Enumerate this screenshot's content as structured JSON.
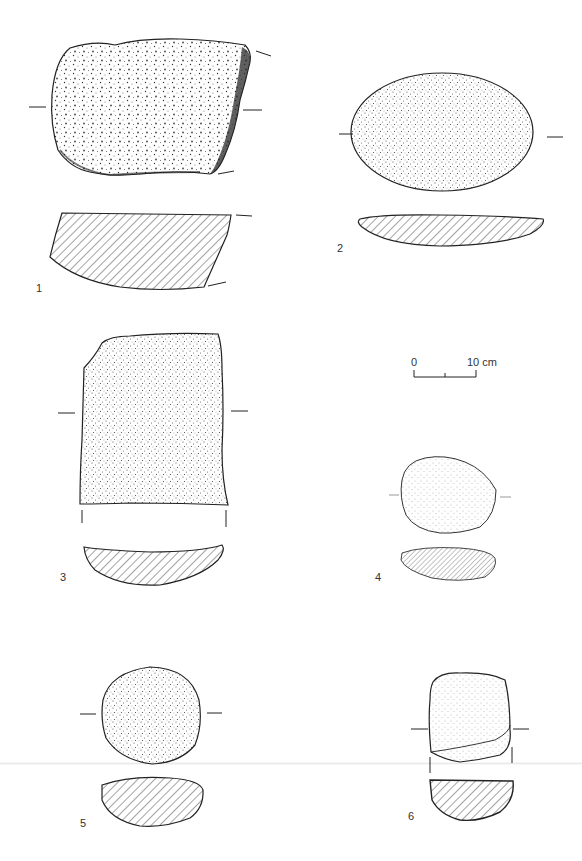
{
  "plate": {
    "subject": "Grinding stones – plan views with cross-sections",
    "colors": {
      "ink": "#222222",
      "paper": "#ffffff",
      "hatch": "#333333"
    }
  },
  "objects": [
    {
      "number": "1",
      "view": "plan + section",
      "shape": "irregular slab, broken edge at right"
    },
    {
      "number": "2",
      "view": "plan + section",
      "shape": "oval"
    },
    {
      "number": "3",
      "view": "plan + section",
      "shape": "rectangular fragment"
    },
    {
      "number": "4",
      "view": "plan + section",
      "shape": "rounded oval"
    },
    {
      "number": "5",
      "view": "plan + section",
      "shape": "circular"
    },
    {
      "number": "6",
      "view": "plan + section",
      "shape": "sub-rectangular"
    }
  ],
  "scale_bar": {
    "start_label": "0",
    "end_label": "10 cm"
  }
}
